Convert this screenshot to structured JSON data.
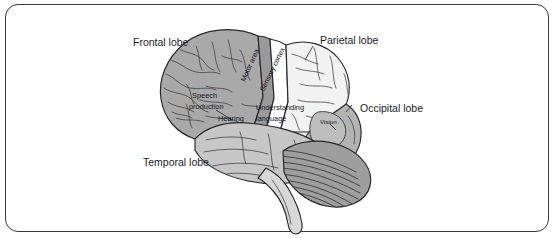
{
  "figure": {
    "border_color": "#3a3a3e",
    "background_color": "#ffffff"
  },
  "labels": {
    "frontal_lobe": "Frontal lobe",
    "parietal_lobe": "Parietal lobe",
    "occipital_lobe": "Occipital lobe",
    "temporal_lobe": "Temporal lobe",
    "motor_area": "Motor area",
    "sensory_cortex": "Sensory cortex",
    "speech_production_line1": "Speech",
    "speech_production_line2": "production",
    "hearing": "Hearing",
    "understanding_line1": "Understanding",
    "understanding_line2": "language",
    "vision": "Vision"
  },
  "regions": {
    "frontal_lobe_fill": "#a9a9a9",
    "parietal_lobe_fill": "#f2f2f2",
    "occipital_lobe_fill": "#b3b3b3",
    "temporal_lobe_fill": "#c6c6c6",
    "motor_strip_fill": "#9a9a9a",
    "sensory_strip_fill": "#ffffff",
    "cerebellum_fill": "#9e9e9e",
    "brainstem_fill": "#d8d8d8",
    "vision_patch_fill": "#bdbdbd",
    "outline_color": "#262629"
  }
}
